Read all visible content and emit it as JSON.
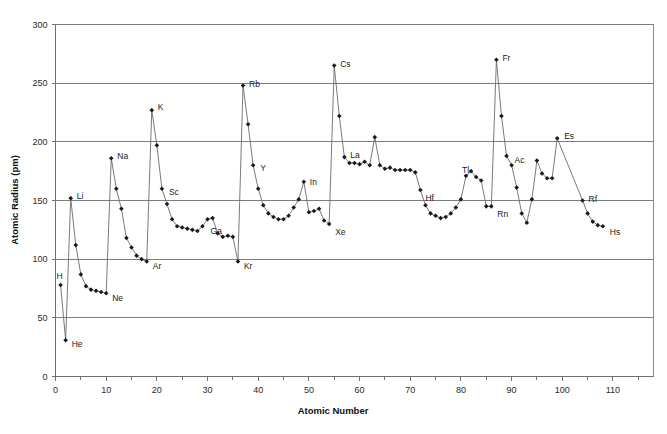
{
  "chart_data": {
    "type": "line",
    "title": "",
    "xlabel": "Atomic Number",
    "ylabel": "Atomic Radius (pm)",
    "xlim": [
      0,
      118
    ],
    "ylim": [
      0,
      300
    ],
    "x_major_ticks": [
      0,
      10,
      20,
      30,
      40,
      50,
      60,
      70,
      80,
      90,
      100,
      110
    ],
    "x_minor_tick_step": 5,
    "y_major_ticks": [
      0,
      50,
      100,
      150,
      200,
      250,
      300
    ],
    "grid": "horizontal",
    "legend": "none",
    "marker": "diamond",
    "series_name": "Atomic Radius",
    "x": [
      1,
      2,
      3,
      4,
      5,
      6,
      7,
      8,
      9,
      10,
      11,
      12,
      13,
      14,
      15,
      16,
      17,
      18,
      19,
      20,
      21,
      22,
      23,
      24,
      25,
      26,
      27,
      28,
      29,
      30,
      31,
      32,
      33,
      34,
      35,
      36,
      37,
      38,
      39,
      40,
      41,
      42,
      43,
      44,
      45,
      46,
      47,
      48,
      49,
      50,
      51,
      52,
      53,
      54,
      55,
      56,
      57,
      58,
      59,
      60,
      61,
      62,
      63,
      64,
      65,
      66,
      67,
      68,
      69,
      70,
      71,
      72,
      73,
      74,
      75,
      76,
      77,
      78,
      79,
      80,
      81,
      82,
      83,
      84,
      85,
      86,
      87,
      88,
      89,
      90,
      91,
      92,
      93,
      94,
      95,
      96,
      97,
      98,
      99,
      104,
      105,
      106,
      107,
      108
    ],
    "values": [
      78,
      31,
      152,
      112,
      87,
      77,
      74,
      73,
      72,
      71,
      186,
      160,
      143,
      118,
      110,
      103,
      100,
      98,
      227,
      197,
      160,
      147,
      134,
      128,
      127,
      126,
      125,
      124,
      128,
      134,
      135,
      122,
      119,
      120,
      119,
      98,
      248,
      215,
      180,
      160,
      146,
      139,
      136,
      134,
      134,
      137,
      144,
      151,
      166,
      140,
      141,
      143,
      133,
      130,
      265,
      222,
      187,
      182,
      182,
      181,
      183,
      180,
      204,
      180,
      177,
      178,
      176,
      176,
      176,
      176,
      174,
      159,
      146,
      139,
      137,
      135,
      136,
      139,
      144,
      151,
      171,
      175,
      170,
      167,
      145,
      145,
      270,
      222,
      188,
      180,
      161,
      139,
      131,
      151,
      184,
      173,
      169,
      169,
      203,
      150,
      139,
      132,
      129,
      128
    ],
    "annotations": [
      {
        "label": "H",
        "x": 1,
        "y": 78,
        "dx": -4,
        "dy": -9
      },
      {
        "label": "He",
        "x": 2,
        "y": 31,
        "dx": 6,
        "dy": 4
      },
      {
        "label": "Li",
        "x": 3,
        "y": 152,
        "dx": 6,
        "dy": -2
      },
      {
        "label": "Ne",
        "x": 10,
        "y": 71,
        "dx": 6,
        "dy": 5
      },
      {
        "label": "Na",
        "x": 11,
        "y": 186,
        "dx": 6,
        "dy": -2
      },
      {
        "label": "Ar",
        "x": 18,
        "y": 98,
        "dx": 6,
        "dy": 4
      },
      {
        "label": "K",
        "x": 19,
        "y": 227,
        "dx": 6,
        "dy": -3
      },
      {
        "label": "Sc",
        "x": 21,
        "y": 160,
        "dx": 7,
        "dy": 3
      },
      {
        "label": "Ga",
        "x": 31,
        "y": 135,
        "dx": -2,
        "dy": 13
      },
      {
        "label": "Kr",
        "x": 36,
        "y": 98,
        "dx": 6,
        "dy": 4
      },
      {
        "label": "Rb",
        "x": 37,
        "y": 248,
        "dx": 6,
        "dy": -2
      },
      {
        "label": "Y",
        "x": 39,
        "y": 180,
        "dx": 7,
        "dy": 3
      },
      {
        "label": "In",
        "x": 49,
        "y": 166,
        "dx": 6,
        "dy": 0
      },
      {
        "label": "Xe",
        "x": 54,
        "y": 130,
        "dx": 6,
        "dy": 8
      },
      {
        "label": "Cs",
        "x": 55,
        "y": 265,
        "dx": 6,
        "dy": -2
      },
      {
        "label": "La",
        "x": 57,
        "y": 187,
        "dx": 6,
        "dy": -2
      },
      {
        "label": "Hf",
        "x": 72,
        "y": 159,
        "dx": 5,
        "dy": 8
      },
      {
        "label": "Tl",
        "x": 81,
        "y": 171,
        "dx": -4,
        "dy": -6
      },
      {
        "label": "Rn",
        "x": 86,
        "y": 145,
        "dx": 6,
        "dy": 8
      },
      {
        "label": "Fr",
        "x": 87,
        "y": 270,
        "dx": 6,
        "dy": -2
      },
      {
        "label": "Ac",
        "x": 89,
        "y": 188,
        "dx": 8,
        "dy": 4
      },
      {
        "label": "Es",
        "x": 99,
        "y": 203,
        "dx": 7,
        "dy": -2
      },
      {
        "label": "Rf",
        "x": 104,
        "y": 150,
        "dx": 6,
        "dy": -2
      },
      {
        "label": "Hs",
        "x": 108,
        "y": 128,
        "dx": 7,
        "dy": 6
      }
    ],
    "colors": {
      "line": "#6b6b6b",
      "marker": "#1a1a1a",
      "grid": "#7d7d7d",
      "axis": "#6f6f6f",
      "background": "#ffffff",
      "text": "#1a1a1a"
    }
  }
}
